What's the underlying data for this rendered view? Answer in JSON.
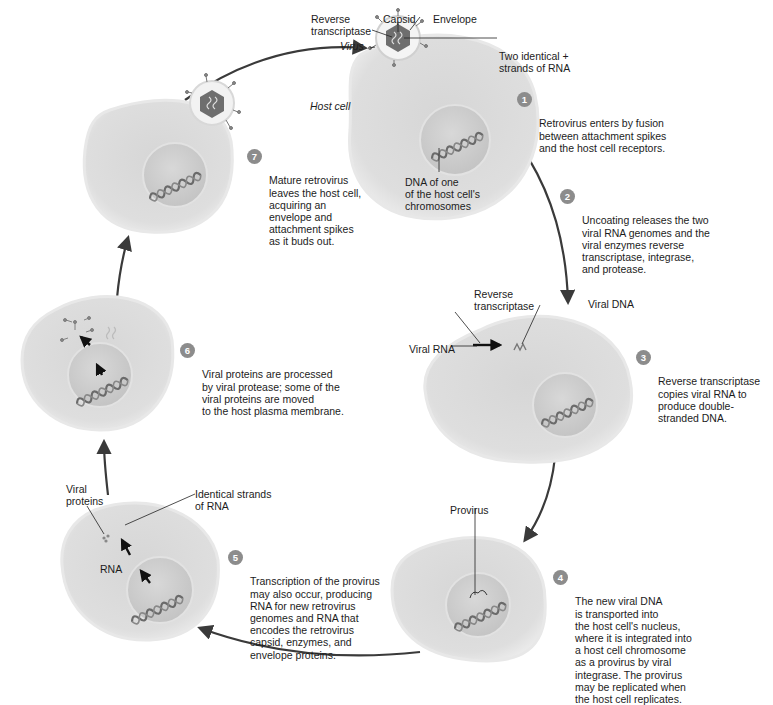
{
  "colors": {
    "cell_fill": "#dcdcdc",
    "cell_rim": "#eeeeee",
    "nucleus_fill": "#cfcfcf",
    "arrow": "#3a3a3a",
    "badge": "#8c8c8c",
    "text": "#1c1c1c"
  },
  "labels": {
    "reverse_transcriptase_top": "Reverse\ntranscriptase",
    "capsid": "Capsid",
    "envelope": "Envelope",
    "virus": "Virus",
    "two_identical_rna": "Two identical +\nstrands of RNA",
    "host_cell": "Host cell",
    "dna_of_host": "DNA of one\nof the host cell's\nchromosomes",
    "reverse_transcriptase_step3": "Reverse\ntranscriptase",
    "viral_dna": "Viral DNA",
    "viral_rna": "Viral RNA",
    "provirus": "Provirus",
    "viral_proteins": "Viral\nproteins",
    "identical_strands": "Identical strands\nof RNA",
    "rna": "RNA"
  },
  "steps": [
    {
      "num": "1",
      "text": "Retrovirus enters by fusion\nbetween attachment spikes\nand the host cell receptors."
    },
    {
      "num": "2",
      "text": "Uncoating releases the two\nviral RNA genomes and the\nviral enzymes reverse\ntranscriptase, integrase,\nand protease."
    },
    {
      "num": "3",
      "text": "Reverse transcriptase\ncopies viral RNA to\nproduce double-\nstranded DNA."
    },
    {
      "num": "4",
      "text": "The new viral DNA\nis transported into\nthe host cell's nucleus,\nwhere it is integrated into\na host cell chromosome\nas a provirus by viral\nintegrase. The provirus\nmay be replicated when\nthe host cell replicates."
    },
    {
      "num": "5",
      "text": "Transcription of the provirus\nmay also occur, producing\nRNA for new retrovirus\ngenomes and RNA that\nencodes the retrovirus\ncapsid, enzymes, and\nenvelope proteins."
    },
    {
      "num": "6",
      "text": "Viral proteins are processed\nby viral protease; some of the\nviral proteins are moved\nto the host plasma membrane."
    },
    {
      "num": "7",
      "text": "Mature retrovirus\nleaves the host cell,\nacquiring an\nenvelope and\nattachment spikes\nas it buds out."
    }
  ]
}
